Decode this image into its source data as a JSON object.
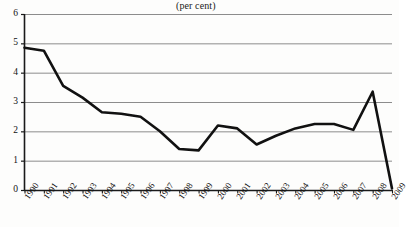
{
  "chart_data": {
    "type": "line",
    "title": "",
    "subtitle": "",
    "unit_label": "(per cent)",
    "xlabel": "",
    "ylabel": "",
    "categories": [
      "1990",
      "1991",
      "1992",
      "1993",
      "1994",
      "1995",
      "1996",
      "1997",
      "1998",
      "1999",
      "2000",
      "2001",
      "2002",
      "2003",
      "2004",
      "2005",
      "2006",
      "2007",
      "2008",
      "2009"
    ],
    "values": [
      4.85,
      4.75,
      3.55,
      3.15,
      2.65,
      2.6,
      2.5,
      2.0,
      1.4,
      1.35,
      2.2,
      2.1,
      1.55,
      1.85,
      2.1,
      2.25,
      2.25,
      2.05,
      3.35,
      0.05
    ],
    "series": [
      {
        "name": "",
        "values": [
          4.85,
          4.75,
          3.55,
          3.15,
          2.65,
          2.6,
          2.5,
          2.0,
          1.4,
          1.35,
          2.2,
          2.1,
          1.55,
          1.85,
          2.1,
          2.25,
          2.25,
          2.05,
          3.35,
          0.05
        ],
        "color": "#111111"
      }
    ],
    "ylim": [
      0,
      6
    ],
    "yticks": [
      0,
      1,
      2,
      3,
      4,
      5,
      6
    ],
    "ytick_labels": [
      "0",
      "1",
      "2",
      "3",
      "4",
      "5",
      "6"
    ],
    "grid": true,
    "grid_color": "#8c8c8c",
    "axis_color": "#1a1a1a",
    "legend": "none",
    "line_color": "#111111",
    "background_color": "#fdfdfc"
  }
}
